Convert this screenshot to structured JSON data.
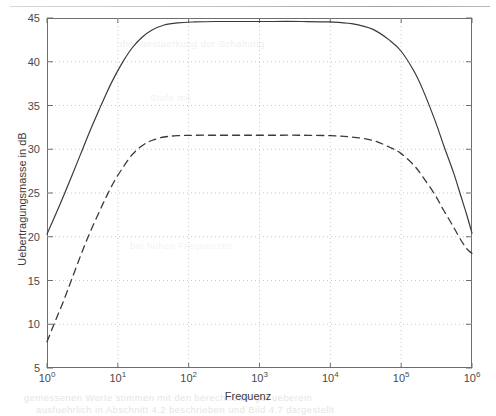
{
  "figure": {
    "background_color": "#ffffff",
    "axis_color": "#6e6e6e",
    "grid_color": "#c8c8c8",
    "curve_color": "#3a3a3a"
  },
  "artifacts": {
    "top_rule": "",
    "bleed_bottom_1": "gemessenen Werte stimmen mit den berechneten gut ueberein",
    "bleed_bottom_2": "ausfuehrlich in Abschnitt 4.2 beschrieben und Bild 4.7 dargestellt",
    "bleed_mid_1": "die Verstaerkung der Schaltung",
    "bleed_mid_2": "Stufe mit",
    "bleed_mid_3": "bei hohen Frequenzen"
  },
  "chart_data": {
    "type": "line",
    "title": "",
    "xlabel": "Frequenz",
    "ylabel": "Uebertragungsmasse in dB",
    "xscale": "log",
    "yscale": "linear",
    "xlim": [
      1,
      1000000
    ],
    "ylim": [
      5,
      45
    ],
    "grid": true,
    "grid_style": "dotted",
    "legend": "none",
    "xticks": [
      1,
      10,
      100,
      1000,
      10000,
      100000,
      1000000
    ],
    "xtick_labels": [
      "10",
      "10",
      "10",
      "10",
      "10",
      "10",
      "10"
    ],
    "xtick_exponents": [
      "0",
      "1",
      "2",
      "3",
      "4",
      "5",
      "6"
    ],
    "yticks": [
      5,
      10,
      15,
      20,
      25,
      30,
      35,
      40,
      45
    ],
    "ytick_labels": [
      "5",
      "10",
      "15",
      "20",
      "25",
      "30",
      "35",
      "40",
      "45"
    ],
    "series": [
      {
        "name": "Solid curve",
        "style": "solid",
        "passband_gain_db": 44.6,
        "x": [
          1,
          1.3,
          1.7,
          2.2,
          3,
          4,
          5.5,
          7,
          9,
          12,
          16,
          22,
          30,
          45,
          70,
          120,
          250,
          600,
          1500,
          4000,
          10000,
          20000,
          40000,
          70000,
          100000,
          150000,
          200000,
          300000,
          400000,
          550000,
          700000,
          850000,
          1000000
        ],
        "y": [
          20.3,
          22.4,
          24.6,
          26.8,
          29.5,
          32.0,
          34.6,
          36.5,
          38.3,
          40.1,
          41.6,
          42.8,
          43.6,
          44.2,
          44.45,
          44.55,
          44.6,
          44.6,
          44.6,
          44.6,
          44.55,
          44.35,
          43.7,
          42.4,
          41.2,
          39.0,
          36.9,
          33.3,
          30.4,
          27.3,
          24.6,
          22.4,
          20.4
        ]
      },
      {
        "name": "Dashed curve",
        "style": "dashed",
        "passband_gain_db": 31.6,
        "x": [
          1,
          1.3,
          1.7,
          2.2,
          3,
          4,
          5.5,
          7,
          9,
          12,
          16,
          22,
          30,
          45,
          70,
          120,
          250,
          600,
          1500,
          4000,
          10000,
          20000,
          40000,
          70000,
          100000,
          150000,
          200000,
          300000,
          400000,
          550000,
          700000,
          850000,
          1000000
        ],
        "y": [
          8.0,
          10.3,
          12.6,
          15.0,
          17.9,
          20.4,
          22.9,
          24.7,
          26.4,
          28.0,
          29.4,
          30.4,
          31.0,
          31.4,
          31.55,
          31.6,
          31.6,
          31.6,
          31.6,
          31.6,
          31.55,
          31.4,
          31.0,
          30.2,
          29.5,
          28.2,
          26.9,
          24.8,
          23.0,
          21.1,
          19.6,
          18.6,
          18.1
        ]
      }
    ]
  }
}
